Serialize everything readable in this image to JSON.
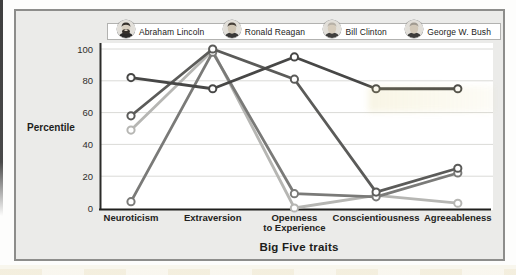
{
  "chart_data": {
    "type": "line",
    "title": "",
    "xlabel": "Big Five traits",
    "ylabel": "Percentile",
    "ylim": [
      0,
      100
    ],
    "yticks": [
      0,
      20,
      40,
      60,
      80,
      100
    ],
    "grid": true,
    "legend_position": "top",
    "categories": [
      "Neuroticism",
      "Extraversion",
      "Openness\nto Experience",
      "Conscientiousness",
      "Agreeableness"
    ],
    "series": [
      {
        "name": "Abraham Lincoln",
        "color": "#474746",
        "values": [
          82,
          75,
          95,
          75,
          75
        ]
      },
      {
        "name": "Ronald Reagan",
        "color": "#7a7a78",
        "values": [
          4,
          98,
          9,
          7,
          22
        ]
      },
      {
        "name": "Bill Clinton",
        "color": "#5b5b59",
        "values": [
          58,
          100,
          81,
          10,
          25
        ]
      },
      {
        "name": "George W. Bush",
        "color": "#b6b6b3",
        "values": [
          49,
          99,
          0,
          8,
          3
        ]
      }
    ]
  },
  "legend": {
    "entries": [
      {
        "label": "Abraham Lincoln",
        "icon": "lincoln-portrait-icon",
        "hair": "#35302b",
        "face": "#d8cfc0",
        "suit": "#2b2a29",
        "beard": true
      },
      {
        "label": "Ronald Reagan",
        "icon": "reagan-portrait-icon",
        "hair": "#474039",
        "face": "#cfc5b4",
        "suit": "#3a3938",
        "beard": false
      },
      {
        "label": "Bill Clinton",
        "icon": "clinton-portrait-icon",
        "hair": "#b7b1a7",
        "face": "#d6ccbc",
        "suit": "#403f3e",
        "beard": false
      },
      {
        "label": "George W. Bush",
        "icon": "bush-portrait-icon",
        "hair": "#a09a90",
        "face": "#d2c8b8",
        "suit": "#3c3b3a",
        "beard": false
      }
    ]
  }
}
